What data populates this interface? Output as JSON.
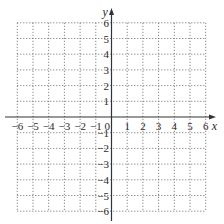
{
  "chart_data": {
    "type": "coordinate-grid",
    "title": "",
    "xlabel": "x",
    "ylabel": "y",
    "xlim": [
      -6,
      6
    ],
    "ylim": [
      -6,
      6
    ],
    "grid": true,
    "grid_style": "dotted",
    "x_ticks": [
      -6,
      -5,
      -4,
      -3,
      -2,
      -1,
      1,
      2,
      3,
      4,
      5,
      6
    ],
    "y_ticks": [
      -6,
      -5,
      -4,
      -3,
      -2,
      -1,
      1,
      2,
      3,
      4,
      5,
      6
    ],
    "origin_label": "0",
    "series": []
  },
  "style": {
    "axis_color": "#333333",
    "grid_color": "#6a6a6a",
    "label_color": "#2a2a2a"
  },
  "layout": {
    "origin_px": [
      111.5,
      117
    ],
    "unit_px": 15.7,
    "x_axis_extent_px": [
      5,
      216
    ],
    "y_axis_extent_px": [
      8,
      221
    ]
  }
}
